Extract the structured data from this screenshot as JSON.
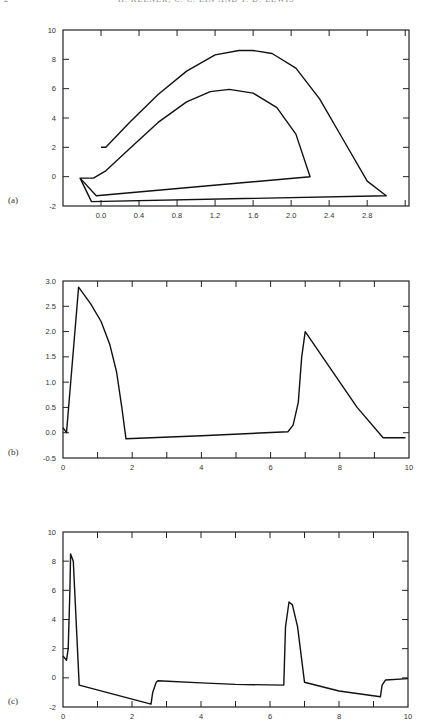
{
  "header": {
    "page_number": "2",
    "running_title": "H. KEENER, C. C. LIN AND T. D. LEWIS"
  },
  "chart_data": [
    {
      "type": "line",
      "panel_label": "(a)",
      "title": "",
      "xlabel": "",
      "ylabel": "",
      "xlim": [
        -0.4,
        3.24
      ],
      "ylim": [
        -2,
        10
      ],
      "xticks": [
        "0.0",
        "0.4",
        "0.8",
        "1.2",
        "1.6",
        "2.0",
        "2.4",
        "2.8"
      ],
      "yticks": [
        "-2",
        "0",
        "2",
        "4",
        "6",
        "8",
        "10"
      ],
      "grid": false,
      "series": [
        {
          "name": "outer loop",
          "x": [
            0.0,
            0.05,
            0.3,
            0.6,
            0.9,
            1.2,
            1.45,
            1.6,
            1.8,
            2.05,
            2.3,
            2.55,
            2.8,
            3.0,
            -0.1,
            -0.22,
            -0.12
          ],
          "y": [
            2.0,
            2.0,
            3.7,
            5.6,
            7.2,
            8.3,
            8.6,
            8.6,
            8.4,
            7.4,
            5.3,
            2.5,
            -0.3,
            -1.3,
            -1.7,
            -0.1,
            -0.1
          ]
        },
        {
          "name": "inner loop",
          "x": [
            -0.12,
            -0.08,
            0.05,
            0.3,
            0.6,
            0.9,
            1.15,
            1.35,
            1.6,
            1.85,
            2.05,
            2.2,
            -0.05,
            -0.22
          ],
          "y": [
            -0.1,
            -0.1,
            0.4,
            1.9,
            3.7,
            5.1,
            5.8,
            5.95,
            5.7,
            4.7,
            2.9,
            0.0,
            -1.3,
            -0.1
          ]
        }
      ]
    },
    {
      "type": "line",
      "panel_label": "(b)",
      "title": "",
      "xlabel": "",
      "ylabel": "",
      "xlim": [
        0,
        10
      ],
      "ylim": [
        -0.5,
        3.0
      ],
      "xticks": [
        "0",
        "2",
        "4",
        "6",
        "8",
        "10"
      ],
      "yticks": [
        "-0.5",
        "0.0",
        "0.5",
        "1.0",
        "1.5",
        "2.0",
        "2.5",
        "3.0"
      ],
      "grid": false,
      "series": [
        {
          "name": "b",
          "x": [
            0.0,
            0.1,
            0.45,
            0.8,
            1.1,
            1.35,
            1.55,
            1.7,
            1.82,
            4.0,
            6.5,
            6.65,
            6.8,
            6.9,
            7.0,
            7.5,
            8.5,
            9.25,
            9.9
          ],
          "y": [
            0.1,
            0.0,
            2.88,
            2.55,
            2.2,
            1.75,
            1.2,
            0.5,
            -0.12,
            -0.06,
            0.02,
            0.15,
            0.6,
            1.5,
            2.0,
            1.5,
            0.5,
            -0.1,
            -0.1
          ]
        }
      ]
    },
    {
      "type": "line",
      "panel_label": "(c)",
      "title": "",
      "xlabel": "",
      "ylabel": "",
      "xlim": [
        0,
        10
      ],
      "ylim": [
        -2,
        10
      ],
      "xticks": [
        "0",
        "2",
        "4",
        "6",
        "8",
        "10"
      ],
      "yticks": [
        "-2",
        "0",
        "2",
        "4",
        "6",
        "8",
        "10"
      ],
      "grid": false,
      "series": [
        {
          "name": "c",
          "x": [
            0.0,
            0.1,
            0.15,
            0.2,
            0.22,
            0.3,
            0.47,
            2.55,
            2.6,
            2.7,
            2.75,
            4.0,
            5.0,
            6.4,
            6.45,
            6.55,
            6.65,
            6.8,
            7.0,
            8.0,
            9.2,
            9.25,
            9.35,
            10.0
          ],
          "y": [
            1.5,
            1.2,
            2.0,
            6.0,
            8.5,
            8.0,
            -0.5,
            -1.8,
            -1.0,
            -0.3,
            -0.2,
            -0.35,
            -0.45,
            -0.5,
            3.5,
            5.2,
            5.0,
            3.5,
            -0.3,
            -0.9,
            -1.3,
            -0.5,
            -0.15,
            -0.05
          ]
        }
      ]
    }
  ]
}
